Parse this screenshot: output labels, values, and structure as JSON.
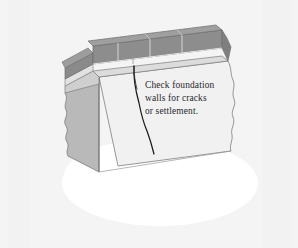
{
  "illustration": {
    "title": "Foundation wall inspection cutaway illustration",
    "background_color": "#f4f4f4",
    "callout": {
      "name": "foundation-callout",
      "lines": [
        "Check foundation",
        "walls for cracks",
        "or settlement."
      ],
      "text_color": "#28282c"
    },
    "parts": {
      "ground_ellipse_label": "ground",
      "ground_color": "#ffffff",
      "brick_course_label": "brick course",
      "brick_face_color": "#8d8d8d",
      "brick_top_color": "#9a9a9a",
      "brick_end_color": "#7d7d7d",
      "mortar_joint_color": "#d8d8d8",
      "foundation_front_label": "foundation wall front face",
      "foundation_front_color": "#f1f1f1",
      "foundation_side_label": "foundation wall side face",
      "foundation_side_color": "#b9b9b9",
      "foundation_ledge_label": "foundation ledge",
      "foundation_ledge_color": "#cfcfcf",
      "crack_label": "settlement crack",
      "crack_color": "#1b1b1b",
      "cutaway_edge_label": "broken cutaway edge",
      "outline_color": "#6e6e72"
    }
  }
}
